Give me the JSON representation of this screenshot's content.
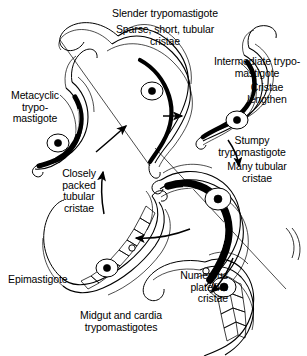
{
  "figure": {
    "background_color": "#ffffff",
    "ink_color": "#000000",
    "width": 307,
    "height": 356
  },
  "labels": {
    "slender": "Slender trypomastigote",
    "sparse_cristae": "Sparse, short, tubular\ncristae",
    "intermediate": "Intermediate trypo-\nmastigote",
    "cristae_lengthen": "Cristae\nlengthen",
    "metacyclic": "Metacyclic\ntrypo-\nmastigote",
    "stumpy": "Stumpy\ntrypomastigote",
    "many_tubular": "Many tubular\ncristae",
    "closely_packed": "Closely\npacked\ntubular\ncristae",
    "epimastigote": "Epimastigote",
    "numerous_platelike": "Numerous\nplatelike\ncristae",
    "midgut": "Midgut and cardia\ntrypomastigotes"
  },
  "organisms": [
    {
      "name": "slender-trypomastigote",
      "stage": "Slender trypomastigote"
    },
    {
      "name": "intermediate-trypomastigote",
      "stage": "Intermediate trypomastigote"
    },
    {
      "name": "stumpy-trypomastigote",
      "stage": "Stumpy trypomastigote"
    },
    {
      "name": "midgut-trypomastigote",
      "stage": "Midgut and cardia trypomastigotes"
    },
    {
      "name": "epimastigote",
      "stage": "Epimastigote"
    },
    {
      "name": "metacyclic-trypomastigote",
      "stage": "Metacyclic trypomastigote"
    }
  ],
  "arrows": [
    {
      "name": "arrow-slender-to-intermediate",
      "direction": "right"
    },
    {
      "name": "arrow-intermediate-to-stumpy",
      "direction": "down-right"
    },
    {
      "name": "arrow-stumpy-to-midgut",
      "direction": "down-left"
    },
    {
      "name": "arrow-midgut-to-epimastigote",
      "direction": "left"
    },
    {
      "name": "arrow-epimastigote-to-metacyclic",
      "direction": "up"
    },
    {
      "name": "arrow-metacyclic-to-slender",
      "direction": "up-right"
    }
  ]
}
